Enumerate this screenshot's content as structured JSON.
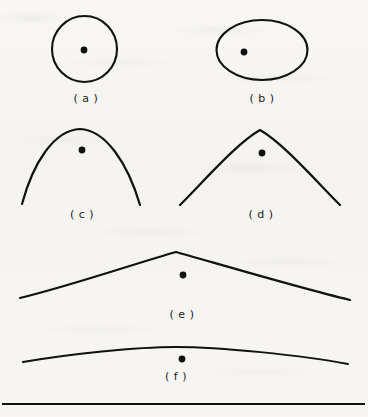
{
  "figure": {
    "type": "line-drawing-panel",
    "background_color": "#f7f6f3",
    "ink_color": "#111111",
    "panel_size": {
      "width": 368,
      "height": 417
    },
    "bottom_rule": {
      "x1": 2,
      "y1": 404,
      "x2": 365,
      "y2": 404,
      "thickness": 2
    },
    "labels": [
      {
        "id": "a",
        "text": "( a )",
        "x": 86,
        "y": 92
      },
      {
        "id": "b",
        "text": "( b )",
        "x": 262,
        "y": 92
      },
      {
        "id": "c",
        "text": "( c )",
        "x": 82,
        "y": 208
      },
      {
        "id": "d",
        "text": "( d )",
        "x": 261,
        "y": 208
      },
      {
        "id": "e",
        "text": "( e )",
        "x": 182,
        "y": 308
      },
      {
        "id": "f",
        "text": "( f )",
        "x": 176,
        "y": 370
      }
    ],
    "shapes": [
      {
        "id": "a",
        "name": "circle-outline",
        "kind": "ellipse",
        "cx": 84.5,
        "cy": 49,
        "rx": 32.5,
        "ry": 33,
        "stroke_width": 2.1
      },
      {
        "id": "b",
        "name": "ellipse-outline",
        "kind": "ellipse",
        "cx": 262,
        "cy": 50,
        "rx": 45.5,
        "ry": 30,
        "stroke_width": 2.1
      },
      {
        "id": "c",
        "name": "narrow-parabolic-arc",
        "kind": "path",
        "d": "M 22 204 C 33 163 54 130 80 129 C 106 130 128 164 140 205",
        "stroke_width": 2.2
      },
      {
        "id": "d",
        "name": "wide-peaked-arc",
        "kind": "path",
        "d": "M 180 205 C 205 180 237 143 260 130 C 283 143 315 180 340 205",
        "stroke_width": 2.2
      },
      {
        "id": "e",
        "name": "broad-shallow-peak-arc",
        "kind": "path",
        "d": "M 20 298 C 70 286 140 262 176 252 C 212 262 296 287 350 300",
        "stroke_width": 2.2
      },
      {
        "id": "f",
        "name": "very-flat-arc",
        "kind": "path",
        "d": "M 23 362 C 70 354 135 347 176 347 C 220 347 300 355 348 364",
        "stroke_width": 2.0
      }
    ],
    "marked_points": [
      {
        "id": "a",
        "name": "center-dot-a",
        "cx": 84,
        "cy": 50,
        "r": 3.4
      },
      {
        "id": "b",
        "name": "center-dot-b",
        "cx": 244,
        "cy": 52,
        "r": 3.4
      },
      {
        "id": "c",
        "name": "center-dot-c",
        "cx": 82,
        "cy": 150,
        "r": 3.4
      },
      {
        "id": "d",
        "name": "center-dot-d",
        "cx": 262,
        "cy": 153,
        "r": 3.4
      },
      {
        "id": "e",
        "name": "center-dot-e",
        "cx": 183,
        "cy": 275,
        "r": 3.4
      },
      {
        "id": "f",
        "name": "center-dot-f",
        "cx": 182,
        "cy": 359,
        "r": 3.4
      }
    ]
  }
}
